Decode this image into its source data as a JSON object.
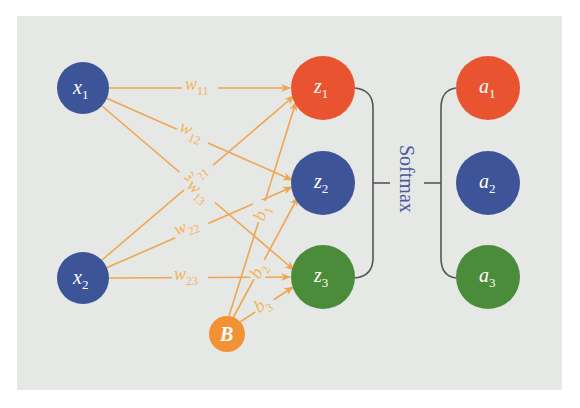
{
  "diagram": {
    "colors": {
      "background": "#e6e8e5",
      "input_node": "#3d5598",
      "edge": "#f0a552",
      "edge_label": "#f4b35a",
      "red_node": "#ea5330",
      "blue_node": "#3d5598",
      "green_node": "#4b8c3a",
      "bias_node": "#f39235",
      "bracket": "#555555",
      "softmax_text": "#4a5a9c"
    },
    "inputs": [
      {
        "id": "x1",
        "base": "x",
        "sub": "1"
      },
      {
        "id": "x2",
        "base": "x",
        "sub": "2"
      }
    ],
    "bias": {
      "id": "B",
      "label": "B"
    },
    "z_nodes": [
      {
        "id": "z1",
        "base": "z",
        "sub": "1",
        "color": "#ea5330"
      },
      {
        "id": "z2",
        "base": "z",
        "sub": "2",
        "color": "#3d5598"
      },
      {
        "id": "z3",
        "base": "z",
        "sub": "3",
        "color": "#4b8c3a"
      }
    ],
    "a_nodes": [
      {
        "id": "a1",
        "base": "a",
        "sub": "1",
        "color": "#ea5330"
      },
      {
        "id": "a2",
        "base": "a",
        "sub": "2",
        "color": "#3d5598"
      },
      {
        "id": "a3",
        "base": "a",
        "sub": "3",
        "color": "#4b8c3a"
      }
    ],
    "weights": [
      {
        "from": "x1",
        "to": "z1",
        "base": "w",
        "sub": "11"
      },
      {
        "from": "x1",
        "to": "z2",
        "base": "w",
        "sub": "12"
      },
      {
        "from": "x1",
        "to": "z3",
        "base": "w",
        "sub": "13"
      },
      {
        "from": "x2",
        "to": "z1",
        "base": "w",
        "sub": "21"
      },
      {
        "from": "x2",
        "to": "z2",
        "base": "w",
        "sub": "22"
      },
      {
        "from": "x2",
        "to": "z3",
        "base": "w",
        "sub": "23"
      }
    ],
    "biases": [
      {
        "from": "B",
        "to": "z1",
        "base": "b",
        "sub": "1"
      },
      {
        "from": "B",
        "to": "z2",
        "base": "b",
        "sub": "2"
      },
      {
        "from": "B",
        "to": "z3",
        "base": "b",
        "sub": "3"
      }
    ],
    "softmax_label": "Softmax"
  }
}
